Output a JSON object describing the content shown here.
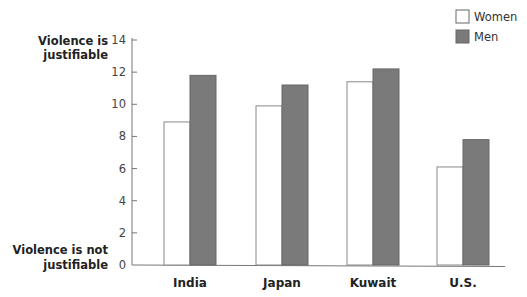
{
  "chart_data": {
    "type": "bar",
    "title": "",
    "xlabel": "",
    "ylabel": "",
    "y_annotations": {
      "top": [
        "Violence is",
        "justifiable"
      ],
      "bottom": [
        "Violence is not",
        "justifiable"
      ]
    },
    "categories": [
      "India",
      "Japan",
      "Kuwait",
      "U.S."
    ],
    "series": [
      {
        "name": "Women",
        "color": "#ffffff",
        "values": [
          8.9,
          9.9,
          11.4,
          6.1
        ]
      },
      {
        "name": "Men",
        "color": "#7a7a7a",
        "values": [
          11.8,
          11.2,
          12.2,
          7.8
        ]
      }
    ],
    "ylim": [
      0,
      14
    ],
    "yticks": [
      0,
      2,
      4,
      6,
      8,
      10,
      12,
      14
    ],
    "grid": false,
    "legend": {
      "position": "top-right",
      "entries": [
        "Women",
        "Men"
      ]
    }
  }
}
